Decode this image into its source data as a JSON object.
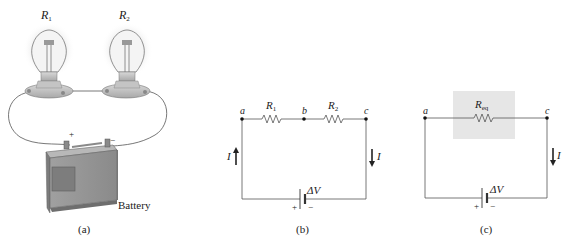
{
  "figure": {
    "panels": [
      {
        "id": "a",
        "caption": "(a)",
        "bulbs": [
          {
            "label": "R",
            "sub": "1"
          },
          {
            "label": "R",
            "sub": "2"
          }
        ],
        "battery_label": "Battery",
        "terminals": {
          "plus": "+",
          "minus": "−"
        }
      },
      {
        "id": "b",
        "caption": "(b)",
        "nodes": [
          "a",
          "b",
          "c"
        ],
        "resistors": [
          {
            "label": "R",
            "sub": "1"
          },
          {
            "label": "R",
            "sub": "2"
          }
        ],
        "current_label": "I",
        "source": {
          "label": "ΔV",
          "plus": "+",
          "minus": "−"
        }
      },
      {
        "id": "c",
        "caption": "(c)",
        "nodes": [
          "a",
          "c"
        ],
        "resistor": {
          "label": "R",
          "sub": "eq"
        },
        "current_label": "I",
        "source": {
          "label": "ΔV",
          "plus": "+",
          "minus": "−"
        }
      }
    ],
    "colors": {
      "wire": "#555555",
      "ink": "#222222",
      "highlight_box": "#e6e6e6",
      "battery_body": "#9a9a9a",
      "bulb_glow": "#e8e8e8"
    }
  }
}
